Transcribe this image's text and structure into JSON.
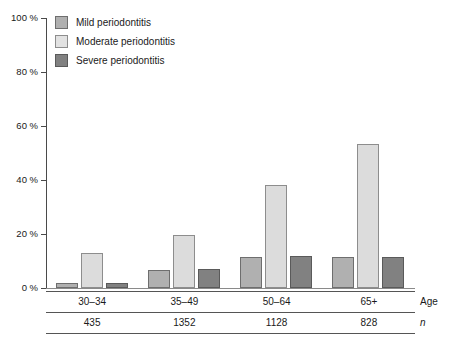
{
  "chart_data": {
    "type": "bar",
    "title": "",
    "subtitle": "",
    "xlabel": "Age",
    "ylabel": "",
    "categories": [
      "30–34",
      "35–49",
      "50–64",
      "65+"
    ],
    "series": [
      {
        "name": "Mild periodontitis",
        "values": [
          2,
          6.5,
          11.5,
          11.5
        ],
        "color": "#b0b0b0"
      },
      {
        "name": "Moderate periodontitis",
        "values": [
          13,
          19.5,
          38,
          53.5
        ],
        "color": "#dcdcdc"
      },
      {
        "name": "Severe periodontitis",
        "values": [
          2,
          7,
          12,
          11.5
        ],
        "color": "#818181"
      }
    ],
    "ylim": [
      0,
      100
    ],
    "yticks": [
      0,
      20,
      40,
      60,
      80,
      100
    ],
    "ytick_labels": [
      "0 %",
      "20 %",
      "40 %",
      "60 %",
      "80 %",
      "100 %"
    ],
    "grid": false,
    "legend_position": "top-left",
    "sample_sizes": [
      "435",
      "1352",
      "1128",
      "828"
    ],
    "sample_size_row_label": "n",
    "axis_row_label": "Age"
  },
  "legend": {
    "items": [
      {
        "label": "Mild periodontitis"
      },
      {
        "label": "Moderate periodontitis"
      },
      {
        "label": "Severe periodontitis"
      }
    ]
  }
}
